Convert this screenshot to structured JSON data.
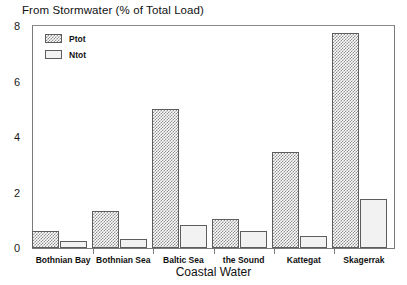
{
  "chart_data": {
    "type": "bar",
    "title": "From Stormwater (% of Total Load)",
    "xlabel": "Coastal Water",
    "ylabel": "",
    "ylim": [
      0,
      8
    ],
    "yticks": [
      0,
      2,
      4,
      6,
      8
    ],
    "ytick_labels": [
      "0",
      "2",
      "4",
      "6",
      "8"
    ],
    "grid": false,
    "legend_position": "top-left",
    "categories": [
      "Bothnian Bay",
      "Bothnian Sea",
      "Baltic Sea",
      "the Sound",
      "Kattegat",
      "Skagerrak"
    ],
    "series": [
      {
        "name": "Ptot",
        "values": [
          0.62,
          1.32,
          5.0,
          1.05,
          3.45,
          7.75
        ]
      },
      {
        "name": "Ntot",
        "values": [
          0.25,
          0.33,
          0.82,
          0.6,
          0.44,
          1.75
        ]
      }
    ]
  },
  "legend": {
    "entries": [
      {
        "label": "Ptot",
        "style": "hatched"
      },
      {
        "label": "Ntot",
        "style": "plain"
      }
    ]
  },
  "colors": {
    "hatch": "#8f8f8f",
    "bar_edge": "#5d5d5d",
    "ntot_fill": "#f2f2f2",
    "axis": "#7a7a7a",
    "text": "#111111"
  }
}
